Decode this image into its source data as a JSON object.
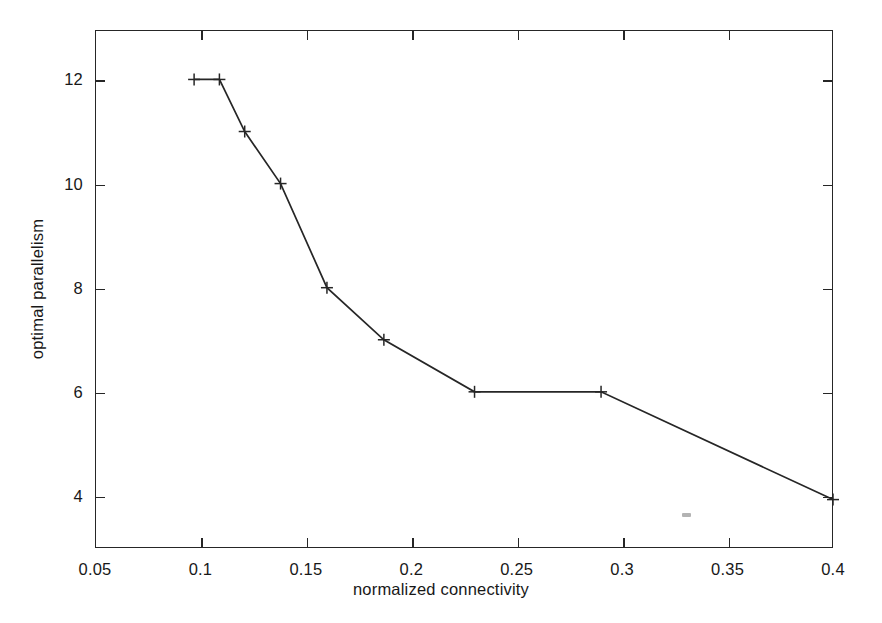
{
  "figure": {
    "background_color": "#ffffff",
    "foreground_color": "#262626"
  },
  "chart_data": {
    "type": "line",
    "title": "",
    "subtitle": "",
    "xlabel": "normalized connectivity",
    "ylabel": "optimal parallelism",
    "xlim": [
      0.05,
      0.4
    ],
    "ylim": [
      3.0,
      12.95
    ],
    "grid": false,
    "legend": null,
    "legend_position": "none",
    "marker": "plus",
    "line_color": "#262626",
    "xticks": [
      0.05,
      0.1,
      0.15,
      0.2,
      0.25,
      0.3,
      0.35,
      0.4
    ],
    "xticklabels": [
      "0.05",
      "0.1",
      "0.15",
      "0.2",
      "0.25",
      "0.3",
      "0.35",
      "0.4"
    ],
    "yticks": [
      4,
      6,
      8,
      10,
      12
    ],
    "yticklabels": [
      "4",
      "6",
      "8",
      "10",
      "12"
    ],
    "series": [
      {
        "name": "optimal parallelism",
        "x": [
          0.097,
          0.109,
          0.121,
          0.138,
          0.16,
          0.187,
          0.23,
          0.29,
          0.4
        ],
        "values": [
          12,
          12,
          11,
          10,
          8,
          7,
          6,
          6,
          3.93
        ]
      }
    ],
    "annotations": []
  }
}
